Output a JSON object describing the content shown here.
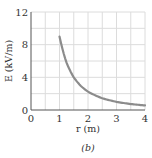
{
  "chart_data": {
    "type": "line",
    "title": "",
    "caption": "(b)",
    "xlabel": "r (m)",
    "ylabel": "E (kV/m)",
    "xlim": [
      0,
      4
    ],
    "ylim": [
      0,
      12
    ],
    "xticks": [
      "0",
      "1",
      "2",
      "3",
      "4"
    ],
    "yticks": [
      "0",
      "4",
      "8",
      "12"
    ],
    "grid": true,
    "grid_x_step": 0.5,
    "grid_y_step": 2,
    "series": [
      {
        "name": "E(r)",
        "color": "#8c8c8c",
        "x": [
          1.0,
          1.25,
          1.5,
          1.75,
          2.0,
          2.5,
          3.0,
          3.5,
          4.0
        ],
        "y": [
          9.0,
          5.76,
          4.0,
          2.94,
          2.25,
          1.44,
          1.0,
          0.73,
          0.56
        ]
      }
    ]
  }
}
